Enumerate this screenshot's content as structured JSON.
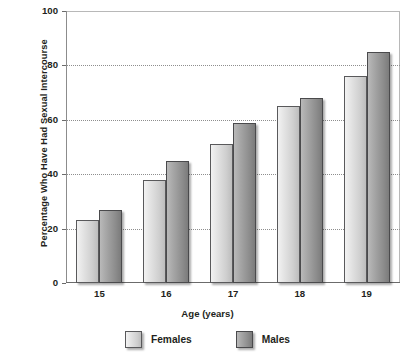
{
  "chart_data": {
    "type": "bar",
    "title": "",
    "xlabel": "Age (years)",
    "ylabel": "Percentage Who Have Had Sexual Intercourse",
    "categories": [
      "15",
      "16",
      "17",
      "18",
      "19"
    ],
    "series": [
      {
        "name": "Females",
        "color": "#d8d8d8",
        "values": [
          23,
          38,
          51,
          65,
          76
        ]
      },
      {
        "name": "Males",
        "color": "#8c8c8c",
        "values": [
          27,
          45,
          59,
          68,
          85
        ]
      }
    ],
    "ylim": [
      0,
      100
    ],
    "yticks": [
      "0",
      "20",
      "40",
      "60",
      "80",
      "100"
    ],
    "ytick_values": [
      0,
      20,
      40,
      60,
      80,
      100
    ],
    "grid": true,
    "gridlines_at": [
      20,
      40,
      60,
      80
    ],
    "legend_position": "bottom"
  },
  "legend": {
    "entries": [
      {
        "label": "Females",
        "swatch": "females-swatch"
      },
      {
        "label": "Males",
        "swatch": "males-swatch"
      }
    ]
  }
}
